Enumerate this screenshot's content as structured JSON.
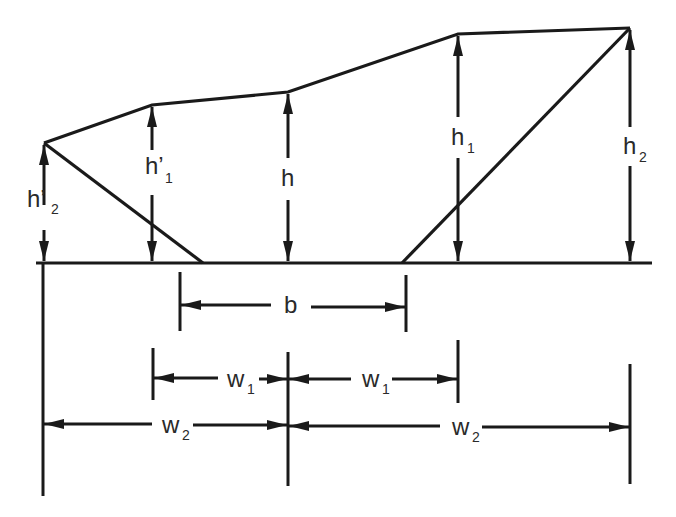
{
  "diagram": {
    "colors": {
      "line": "#1a1a1a",
      "text": "#2a2a2a",
      "background": "#ffffff"
    },
    "vertical_dimensions": [
      {
        "id": "h2p",
        "label": "h",
        "prime": "’",
        "sub": "2"
      },
      {
        "id": "h1p",
        "label": "h",
        "prime": "’",
        "sub": "1"
      },
      {
        "id": "h",
        "label": "h",
        "prime": "",
        "sub": ""
      },
      {
        "id": "h1",
        "label": "h",
        "prime": "",
        "sub": "1"
      },
      {
        "id": "h2",
        "label": "h",
        "prime": "",
        "sub": "2"
      }
    ],
    "horizontal_dimensions": {
      "b": {
        "label": "b",
        "sub": ""
      },
      "w1_left": {
        "label": "w",
        "sub": "1"
      },
      "w1_right": {
        "label": "w",
        "sub": "1"
      },
      "w2_left": {
        "label": "w",
        "sub": "2"
      },
      "w2_right": {
        "label": "w",
        "sub": "2"
      }
    }
  }
}
